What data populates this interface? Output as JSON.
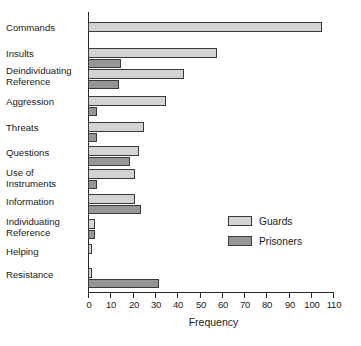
{
  "chart_data": {
    "type": "bar",
    "orientation": "horizontal",
    "title": "",
    "xlabel": "Frequency",
    "ylabel": "",
    "xlim": [
      0,
      110
    ],
    "xticks": [
      0,
      10,
      20,
      30,
      40,
      50,
      60,
      70,
      80,
      90,
      100,
      110
    ],
    "grid": false,
    "legend_position": "middle-right",
    "categories": [
      "Commands",
      "Insults",
      "Deindividuating\nReference",
      "Aggression",
      "Threats",
      "Questions",
      "Use of\nInstruments",
      "Information",
      "Individuating\nReference",
      "Helping",
      "Resistance"
    ],
    "series": [
      {
        "name": "Guards",
        "color": "#d3d3d3",
        "values": [
          105,
          58,
          43,
          35,
          25,
          23,
          21,
          21,
          3,
          2,
          2
        ]
      },
      {
        "name": "Prisoners",
        "color": "#969696",
        "values": [
          0,
          15,
          14,
          4,
          4,
          19,
          4,
          24,
          3,
          0,
          32
        ]
      }
    ]
  },
  "axis": {
    "tick_labels": [
      "0",
      "10",
      "20",
      "30",
      "40",
      "50",
      "60",
      "70",
      "80",
      "90",
      "100",
      "110"
    ],
    "x_title": "Frequency"
  },
  "legend": {
    "items": [
      {
        "label": "Guards"
      },
      {
        "label": "Prisoners"
      }
    ]
  }
}
